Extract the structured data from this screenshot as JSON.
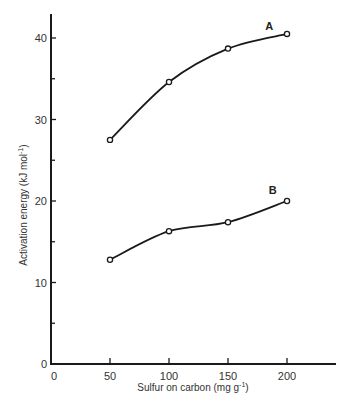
{
  "chart_data": {
    "type": "line",
    "title": "",
    "xlabel": "Sulfur on carbon (mg g",
    "xlabel_sup": "-1",
    "xlabel_close": ")",
    "ylabel": "Activation energy (kJ mol",
    "ylabel_sup": "-1",
    "ylabel_close": ")",
    "x_ticks": [
      0,
      50,
      100,
      150,
      200
    ],
    "y_ticks": [
      0,
      10,
      20,
      30,
      40
    ],
    "y_minor_ticks": [
      5,
      15,
      25,
      35
    ],
    "xlim": [
      0,
      240
    ],
    "ylim": [
      0,
      43
    ],
    "grid": false,
    "legend": "inline labels",
    "marker": "open-circle",
    "x": [
      50,
      100,
      150,
      200
    ],
    "series": [
      {
        "name": "A",
        "values": [
          27.5,
          34.6,
          38.7,
          40.5
        ]
      },
      {
        "name": "B",
        "values": [
          12.8,
          16.3,
          17.4,
          20.0
        ]
      }
    ],
    "annotations": [
      {
        "text": "A",
        "x": 185,
        "y": 41.0
      },
      {
        "text": "B",
        "x": 188,
        "y": 20.8
      }
    ]
  }
}
